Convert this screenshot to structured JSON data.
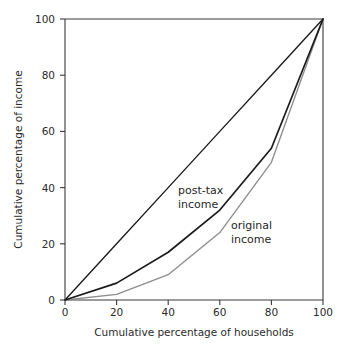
{
  "chart_data": {
    "type": "line",
    "title": "",
    "xlabel": "Cumulative percentage of households",
    "ylabel": "Cumulative percentage of income",
    "xlim": [
      0,
      100
    ],
    "ylim": [
      0,
      100
    ],
    "xticks": [
      0,
      20,
      40,
      60,
      80,
      100
    ],
    "yticks": [
      0,
      20,
      40,
      60,
      80,
      100
    ],
    "xtick_labels": [
      "0",
      "20",
      "40",
      "60",
      "80",
      "100"
    ],
    "ytick_labels": [
      "0",
      "20",
      "40",
      "60",
      "80",
      "100"
    ],
    "grid": false,
    "legend_position": "inline-annotations",
    "x": [
      0,
      20,
      40,
      60,
      80,
      100
    ],
    "series": [
      {
        "name": "line of equality",
        "label": "",
        "color": "#1a1a1a",
        "values": [
          0,
          20,
          40,
          60,
          80,
          100
        ]
      },
      {
        "name": "post-tax income",
        "label": "post-tax income",
        "label_line1": "post-tax",
        "label_line2": "income",
        "color": "#1a1a1a",
        "values": [
          0,
          6,
          17,
          32,
          54,
          100
        ]
      },
      {
        "name": "original income",
        "label": "original income",
        "label_line1": "original",
        "label_line2": "income",
        "color": "#8d8d8d",
        "values": [
          0,
          2,
          9,
          24,
          49,
          100
        ]
      }
    ]
  },
  "axes": {
    "x_title": "Cumulative percentage of households",
    "y_title": "Cumulative percentage of income"
  },
  "annotations": {
    "posttax": {
      "line1": "post-tax",
      "line2": "income"
    },
    "original": {
      "line1": "original",
      "line2": "income"
    }
  },
  "ticks": {
    "x": [
      "0",
      "20",
      "40",
      "60",
      "80",
      "100"
    ],
    "y": [
      "0",
      "20",
      "40",
      "60",
      "80",
      "100"
    ]
  }
}
